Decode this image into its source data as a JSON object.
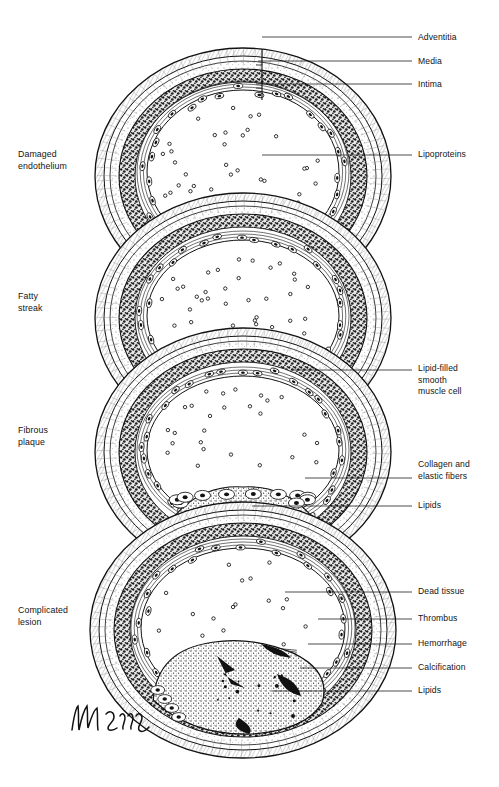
{
  "figure": {
    "signature": "artist signature",
    "ink_color": "#111111",
    "background": "#ffffff"
  },
  "stages": [
    {
      "id": "damaged-endothelium",
      "label": "Damaged\nendothelium",
      "x": 18,
      "y": 148
    },
    {
      "id": "fatty-streak",
      "label": "Fatty\nstreak",
      "x": 18,
      "y": 290
    },
    {
      "id": "fibrous-plaque",
      "label": "Fibrous\nplaque",
      "x": 18,
      "y": 424
    },
    {
      "id": "complicated-lesion",
      "label": "Complicated\nlesion",
      "x": 18,
      "y": 604
    }
  ],
  "callouts": [
    {
      "id": "adventitia",
      "label": "Adventitia",
      "y": 32,
      "line_from_x": 262,
      "line_from_y": 37,
      "line_to_x": 412,
      "line_to_y": 37
    },
    {
      "id": "media",
      "label": "Media",
      "y": 56,
      "line_from_x": 258,
      "line_from_y": 61,
      "line_to_x": 412,
      "line_to_y": 61
    },
    {
      "id": "intima",
      "label": "Intima",
      "y": 79,
      "line_from_x": 256,
      "line_from_y": 84,
      "line_to_x": 412,
      "line_to_y": 84
    },
    {
      "id": "lipoproteins",
      "label": "Lipoproteins",
      "y": 149,
      "line_from_x": 262,
      "line_from_y": 155,
      "line_to_x": 412,
      "line_to_y": 155
    },
    {
      "id": "lipid-filled-smooth-muscle-cell",
      "label": "Lipid-filled\nsmooth\nmuscle cell",
      "y": 363,
      "line_from_x": 292,
      "line_from_y": 370,
      "line_to_x": 412,
      "line_to_y": 370
    },
    {
      "id": "collagen-and-elastic-fibers",
      "label": "Collagen and\nelastic fibers",
      "y": 459,
      "line_from_x": 305,
      "line_from_y": 478,
      "line_to_x": 412,
      "line_to_y": 478
    },
    {
      "id": "lipids-plaque",
      "label": "Lipids",
      "y": 500,
      "line_from_x": 252,
      "line_from_y": 506,
      "line_to_x": 412,
      "line_to_y": 506
    },
    {
      "id": "dead-tissue",
      "label": "Dead tissue",
      "y": 586,
      "line_from_x": 285,
      "line_from_y": 592,
      "line_to_x": 412,
      "line_to_y": 592
    },
    {
      "id": "thrombus",
      "label": "Thrombus",
      "y": 613,
      "line_from_x": 318,
      "line_from_y": 619,
      "line_to_x": 412,
      "line_to_y": 619
    },
    {
      "id": "hemorrhage",
      "label": "Hemorrhage",
      "y": 638,
      "line_from_x": 308,
      "line_from_y": 644,
      "line_to_x": 412,
      "line_to_y": 644
    },
    {
      "id": "calcification",
      "label": "Calcification",
      "y": 662,
      "line_from_x": 300,
      "line_from_y": 668,
      "line_to_x": 412,
      "line_to_y": 668
    },
    {
      "id": "lipids-lesion",
      "label": "Lipids",
      "y": 685,
      "line_from_x": 272,
      "line_from_y": 691,
      "line_to_x": 412,
      "line_to_y": 691
    }
  ],
  "rings": [
    {
      "id": "ring-damaged-endothelium",
      "cx": 243,
      "cy": 176,
      "rx": 148,
      "ry": 128,
      "lumen_rx": 96,
      "lumen_ry": 82,
      "lumen_cy": 172,
      "lipoprotein_count": 46,
      "has_arrow": true,
      "lesion": "none"
    },
    {
      "id": "ring-fatty-streak",
      "cx": 243,
      "cy": 318,
      "rx": 148,
      "ry": 125,
      "lumen_rx": 96,
      "lumen_ry": 76,
      "lumen_cy": 316,
      "lipoprotein_count": 34,
      "has_arrow": false,
      "lesion": "streak"
    },
    {
      "id": "ring-fibrous-plaque",
      "cx": 243,
      "cy": 452,
      "rx": 148,
      "ry": 124,
      "lumen_rx": 96,
      "lumen_ry": 74,
      "lumen_cy": 450,
      "lipoprotein_count": 26,
      "has_arrow": false,
      "lesion": "plaque"
    },
    {
      "id": "ring-complicated-lesion",
      "cx": 243,
      "cy": 630,
      "rx": 153,
      "ry": 128,
      "lumen_rx": 102,
      "lumen_ry": 80,
      "lumen_cy": 628,
      "lipoprotein_count": 18,
      "has_arrow": false,
      "lesion": "complicated"
    }
  ]
}
